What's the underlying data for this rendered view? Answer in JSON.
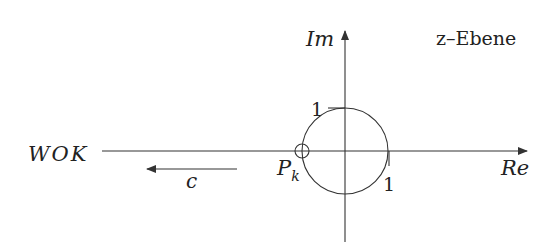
{
  "diagram": {
    "title": "z–Ebene",
    "axes": {
      "real_label": "Re",
      "imag_label": "Im",
      "origin": [
        345,
        151
      ]
    },
    "unit_circle": {
      "radius_label_imag": "1",
      "radius_label_real": "1"
    },
    "pole": {
      "label_main": "P",
      "label_sub": "k"
    },
    "left_label": "WOK",
    "direction_arrow": {
      "label": "c"
    },
    "colors": {
      "line": "#333333",
      "text": "#222222",
      "background": "#ffffff"
    }
  }
}
